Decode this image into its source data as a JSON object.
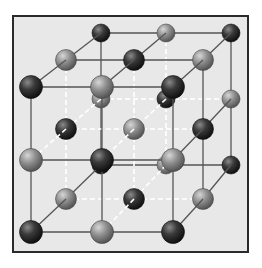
{
  "diagram": {
    "type": "crystal-lattice",
    "colors": {
      "background": "#ffffff",
      "panel": "#e8e8e8",
      "border": "#2a2a2a",
      "edge_line": "#555555",
      "dashed_line": "#ffffff",
      "dark_atom": "#2f2f2f",
      "light_atom": "#8a8a8a"
    },
    "frame": {
      "x": 13,
      "y": 16,
      "width": 235,
      "height": 236
    },
    "layers": [
      {
        "name": "back",
        "xs": [
          101,
          166,
          231
        ],
        "ys": [
          33,
          99,
          165
        ]
      },
      {
        "name": "middle",
        "xs": [
          66,
          134,
          203
        ],
        "ys": [
          60,
          129,
          199
        ]
      },
      {
        "name": "front",
        "xs": [
          31,
          102,
          173
        ],
        "ys": [
          87,
          160,
          232
        ]
      }
    ],
    "atom_radius": {
      "back": 9,
      "middle": 10.5,
      "front": 11.5
    }
  }
}
